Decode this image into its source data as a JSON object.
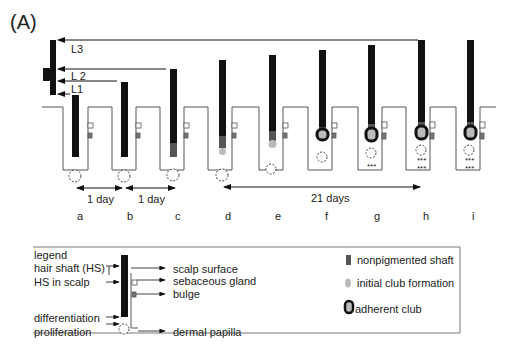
{
  "panel_label": "(A)",
  "length_markers": [
    "L3",
    "L 2",
    "L1"
  ],
  "intervals": [
    {
      "label": "1 day",
      "from": "a",
      "to": "b"
    },
    {
      "label": "1 day",
      "from": "b",
      "to": "c"
    },
    {
      "label": "21 days",
      "from": "d",
      "to": "h"
    }
  ],
  "stages": [
    "a",
    "b",
    "c",
    "d",
    "e",
    "f",
    "g",
    "h",
    "i"
  ],
  "legend": {
    "title": "legend",
    "left_labels": [
      "hair shaft (HS)",
      "HS in scalp",
      "differentiation",
      "proliferation"
    ],
    "right_labels": [
      "scalp surface",
      "sebaceous gland",
      "bulge",
      "dermal papilla"
    ],
    "key": [
      {
        "label": "nonpigmented shaft",
        "color": "#555555"
      },
      {
        "label": "initial club formation",
        "color": "#bbbbbb"
      },
      {
        "label": "adherent club",
        "color": "#111111"
      }
    ]
  },
  "colors": {
    "shaft": "#111111",
    "nonpigmented": "#555555",
    "club_light": "#bbbbbb",
    "outline": "#555555"
  }
}
